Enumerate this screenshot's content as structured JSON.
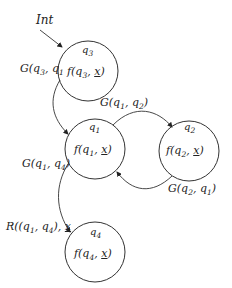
{
  "diagram": {
    "type": "state-machine",
    "colors": {
      "stroke": "#333333",
      "text": "#222222",
      "background": "#ffffff"
    },
    "initial": {
      "label": "Int",
      "target": "q3"
    },
    "states": [
      {
        "id": "q3",
        "name": "q3",
        "content": "f(q3, x)",
        "cx": 88,
        "cy": 71,
        "r": 30
      },
      {
        "id": "q1",
        "name": "q1",
        "content": "f(q1, x)",
        "cx": 95,
        "cy": 149,
        "r": 30
      },
      {
        "id": "q2",
        "name": "q2",
        "content": "f(q2, x)",
        "cx": 189,
        "cy": 151,
        "r": 30
      },
      {
        "id": "q4",
        "name": "q4",
        "content": "f(q4, x)",
        "cx": 95,
        "cy": 252,
        "r": 30
      }
    ],
    "transitions": [
      {
        "from": "q3",
        "to": "q1",
        "label": "G(q3, q1)"
      },
      {
        "from": "q1",
        "to": "q2",
        "label": "G(q1, q2)"
      },
      {
        "from": "q2",
        "to": "q1",
        "label": "G(q2, q1)"
      },
      {
        "from": "q1",
        "to": "q4",
        "label": "G(q1, q4)"
      },
      {
        "from": "q1",
        "to": "q4",
        "label": "R((q1, q4), x)",
        "note": "reset label at q4 entry"
      }
    ]
  }
}
